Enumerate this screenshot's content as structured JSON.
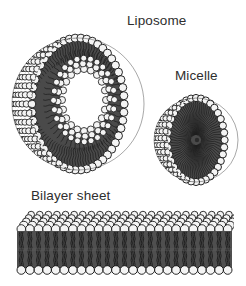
{
  "figure": {
    "background_color": "#ffffff",
    "ink_color": "#1a1a1a",
    "label_color": "#2e2e2e",
    "width": 246,
    "height": 286
  },
  "labels": {
    "liposome": "Liposome",
    "micelle": "Micelle",
    "bilayer": "Bilayer sheet"
  },
  "structures": [
    {
      "id": "liposome",
      "label": "Liposome",
      "kind": "cut-away-sphere-bilayer",
      "description": "Spherical vesicle cut open to reveal a lipid bilayer enclosing an aqueous cavity",
      "center": {
        "x": 78,
        "y": 104
      },
      "outer_radius": 66,
      "cavity_radius": 24,
      "head_color": "#f2f2f2",
      "head_outline": "#111111",
      "tail_color": "#3a3a3a"
    },
    {
      "id": "micelle",
      "label": "Micelle",
      "kind": "cut-away-sphere-monolayer",
      "description": "Spherical monolayer cut open to reveal hydrophobic tails radiating to the core",
      "center": {
        "x": 196,
        "y": 140
      },
      "outer_radius": 42,
      "head_color": "#f2f2f2",
      "head_outline": "#111111",
      "tail_color": "#3a3a3a"
    },
    {
      "id": "bilayer",
      "label": "Bilayer sheet",
      "kind": "planar-bilayer-slab",
      "description": "Flat lipid bilayer slab drawn in perspective with head groups on both faces",
      "bounds": {
        "x": 17,
        "y": 209,
        "width": 215,
        "height": 70
      },
      "top_face_rows": 5,
      "heads_per_row": 25,
      "head_color": "#f2f2f2",
      "head_outline": "#111111",
      "tail_color": "#3a3a3a"
    }
  ]
}
